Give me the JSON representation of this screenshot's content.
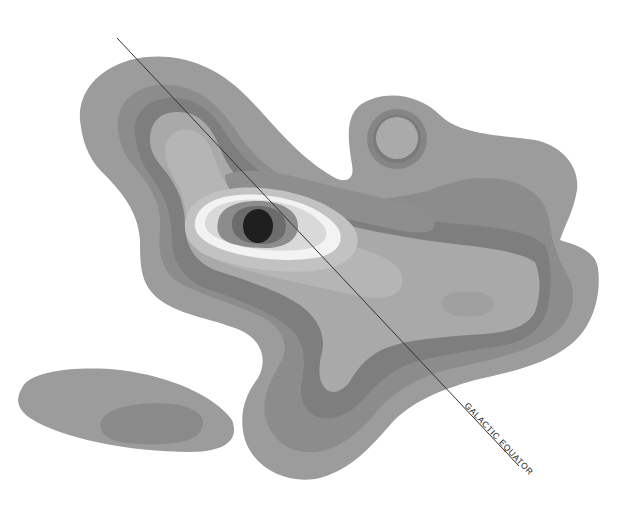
{
  "map": {
    "type": "contour-intensity-map",
    "annotation": {
      "label": "GALACTIC EQUATOR",
      "line": {
        "x1": 117,
        "y1": 38,
        "x2": 519,
        "y2": 466
      }
    },
    "colors": {
      "background": "#ffffff",
      "level_1_outer": "#9a9a9a",
      "level_2": "#8a8a8a",
      "level_3": "#7e7e7e",
      "level_4": "#a8a8a8",
      "level_5": "#b8b8b8",
      "level_6_bright": "#dedede",
      "level_7_white": "#f4f4f4",
      "core_ring_1": "#8c8c8c",
      "core_ring_2": "#6a6a6a",
      "core": "#1e1e1e",
      "line": "#333333"
    },
    "features": [
      "main-emission-region",
      "north-arm",
      "bright-central-source",
      "compact-circular-source",
      "eastern-extension",
      "southern-lobe",
      "detached-south-west-cloud"
    ]
  }
}
